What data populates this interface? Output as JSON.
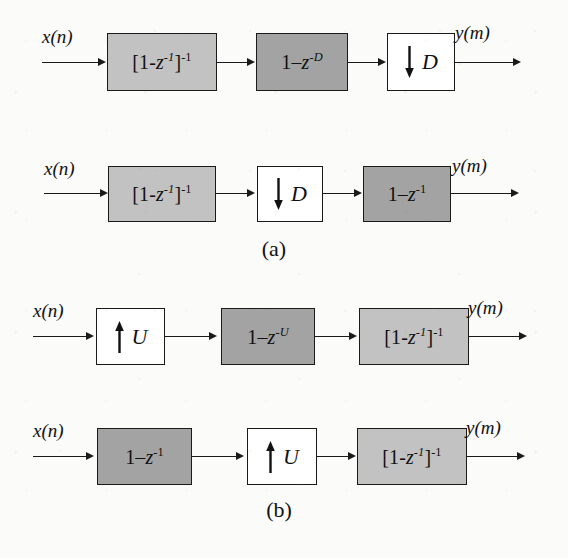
{
  "figure": {
    "input_label": "x(n)",
    "output_label": "y(m)",
    "colors": {
      "block_light_gray": "#c2c2c2",
      "block_dark_gray": "#a3a3a3",
      "block_white": "#ffffff",
      "line": "#1a1a1a",
      "background": "#fbfbfa"
    }
  },
  "subfigures": [
    {
      "caption": "(a)",
      "rows": [
        {
          "id": "row-1",
          "input_label": "x(n)",
          "output_label": "y(m)",
          "blocks": [
            {
              "id": "integrator",
              "kind": "transfer-function",
              "shade": "light",
              "text": "[1-z⁻¹]⁻¹",
              "base": "[1-",
              "var": "z",
              "exp1": "-1",
              "close": "]",
              "exp2": "-1"
            },
            {
              "id": "comb-D",
              "kind": "transfer-function",
              "shade": "dark",
              "text": "1−z⁻ᴰ",
              "base": "1–",
              "var": "z",
              "exp1": "-D"
            },
            {
              "id": "decimator-D",
              "kind": "rate-change",
              "shade": "white",
              "arrow": "down-arrow-icon",
              "factor": "D",
              "text": "↓ D"
            }
          ]
        },
        {
          "id": "row-2",
          "input_label": "x(n)",
          "output_label": "y(m)",
          "blocks": [
            {
              "id": "integrator",
              "kind": "transfer-function",
              "shade": "light",
              "text": "[1-z⁻¹]⁻¹",
              "base": "[1-",
              "var": "z",
              "exp1": "-1",
              "close": "]",
              "exp2": "-1"
            },
            {
              "id": "decimator-D",
              "kind": "rate-change",
              "shade": "white",
              "arrow": "down-arrow-icon",
              "factor": "D",
              "text": "↓ D"
            },
            {
              "id": "comb-1",
              "kind": "transfer-function",
              "shade": "dark",
              "text": "1−z⁻¹",
              "base": "1–",
              "var": "z",
              "exp1": "-1"
            }
          ]
        }
      ]
    },
    {
      "caption": "(b)",
      "rows": [
        {
          "id": "row-3",
          "input_label": "x(n)",
          "output_label": "y(m)",
          "blocks": [
            {
              "id": "interpolator-U",
              "kind": "rate-change",
              "shade": "white",
              "arrow": "up-arrow-icon",
              "factor": "U",
              "text": "↑ U"
            },
            {
              "id": "comb-U",
              "kind": "transfer-function",
              "shade": "dark",
              "text": "1−z⁻ᵁ",
              "base": "1–",
              "var": "z",
              "exp1": "-U"
            },
            {
              "id": "integrator",
              "kind": "transfer-function",
              "shade": "light",
              "text": "[1-z⁻¹]⁻¹",
              "base": "[1-",
              "var": "z",
              "exp1": "-1",
              "close": "]",
              "exp2": "-1"
            }
          ]
        },
        {
          "id": "row-4",
          "input_label": "x(n)",
          "output_label": "y(m)",
          "blocks": [
            {
              "id": "comb-1",
              "kind": "transfer-function",
              "shade": "dark",
              "text": "1−z⁻¹",
              "base": "1–",
              "var": "z",
              "exp1": "-1"
            },
            {
              "id": "interpolator-U",
              "kind": "rate-change",
              "shade": "white",
              "arrow": "up-arrow-icon",
              "factor": "U",
              "text": "↑ U"
            },
            {
              "id": "integrator",
              "kind": "transfer-function",
              "shade": "light",
              "text": "[1-z⁻¹]⁻¹",
              "base": "[1-",
              "var": "z",
              "exp1": "-1",
              "close": "]",
              "exp2": "-1"
            }
          ]
        }
      ]
    }
  ]
}
